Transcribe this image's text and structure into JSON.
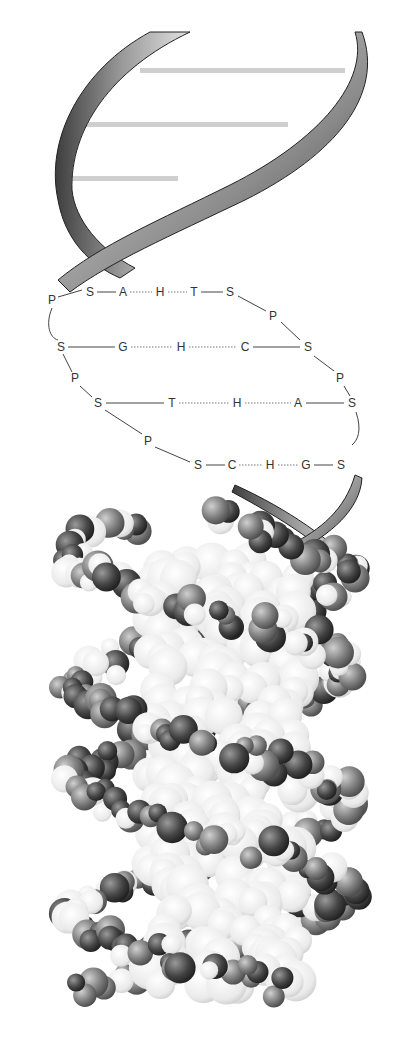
{
  "figure": {
    "panels": [
      "ribbon-model",
      "chemical-schematic",
      "space-filling-model"
    ]
  },
  "schematic": {
    "legend_letters": {
      "P": "phosphate",
      "S": "sugar",
      "A": "adenine",
      "T": "thymine",
      "G": "guanine",
      "C": "cytosine",
      "H": "hydrogen bond"
    },
    "rows": [
      {
        "left": [
          "S",
          "A"
        ],
        "middle": "H",
        "right": [
          "T",
          "S"
        ]
      },
      {
        "left": [
          "S",
          "G"
        ],
        "middle": "H",
        "right": [
          "C",
          "S"
        ]
      },
      {
        "left": [
          "S",
          "T"
        ],
        "middle": "H",
        "right": [
          "A",
          "S"
        ]
      },
      {
        "left": [
          "S",
          "C"
        ],
        "middle": "H",
        "right": [
          "G",
          "S"
        ]
      }
    ],
    "backbone_left": [
      "P",
      "S",
      "P",
      "S",
      "P",
      "S"
    ],
    "backbone_right": [
      "S",
      "P",
      "S",
      "P",
      "S",
      "S"
    ]
  },
  "labels": [
    {
      "t": "P",
      "x": 52,
      "y": 300
    },
    {
      "t": "S",
      "x": 90,
      "y": 292
    },
    {
      "t": "A",
      "x": 123,
      "y": 292
    },
    {
      "t": "H",
      "x": 160,
      "y": 292
    },
    {
      "t": "T",
      "x": 194,
      "y": 292
    },
    {
      "t": "S",
      "x": 230,
      "y": 292
    },
    {
      "t": "P",
      "x": 273,
      "y": 316
    },
    {
      "t": "S",
      "x": 61,
      "y": 347
    },
    {
      "t": "G",
      "x": 123,
      "y": 347
    },
    {
      "t": "H",
      "x": 181,
      "y": 347
    },
    {
      "t": "C",
      "x": 245,
      "y": 347
    },
    {
      "t": "S",
      "x": 308,
      "y": 347
    },
    {
      "t": "P",
      "x": 75,
      "y": 378
    },
    {
      "t": "P",
      "x": 340,
      "y": 378
    },
    {
      "t": "S",
      "x": 98,
      "y": 403
    },
    {
      "t": "T",
      "x": 172,
      "y": 403
    },
    {
      "t": "H",
      "x": 237,
      "y": 403
    },
    {
      "t": "A",
      "x": 298,
      "y": 403
    },
    {
      "t": "S",
      "x": 352,
      "y": 403
    },
    {
      "t": "P",
      "x": 148,
      "y": 441
    },
    {
      "t": "S",
      "x": 198,
      "y": 465
    },
    {
      "t": "C",
      "x": 232,
      "y": 465
    },
    {
      "t": "H",
      "x": 270,
      "y": 465
    },
    {
      "t": "G",
      "x": 306,
      "y": 465
    },
    {
      "t": "S",
      "x": 341,
      "y": 465
    }
  ],
  "colors": {
    "ribbon_dark": "#4a4a4a",
    "ribbon_light": "#d8d8d8",
    "rung": "#cfcfcf",
    "atom_dark": "#3a3a3a",
    "atom_mid": "#7a7a7a",
    "atom_light": "#ececec",
    "text": "#333333"
  }
}
